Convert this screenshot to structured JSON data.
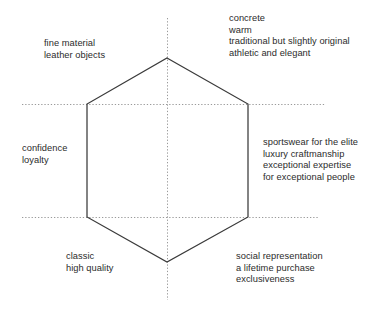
{
  "diagram": {
    "type": "hexagon-brand-positioning",
    "shape": {
      "name": "hexagon",
      "stroke_color": "#3a3a3a",
      "fill": "none",
      "vertices": [
        {
          "name": "top",
          "x": 167,
          "y": 58
        },
        {
          "name": "upper-right",
          "x": 248,
          "y": 104
        },
        {
          "name": "lower-right",
          "x": 248,
          "y": 217
        },
        {
          "name": "bottom",
          "x": 167,
          "y": 262
        },
        {
          "name": "lower-left",
          "x": 87,
          "y": 217
        },
        {
          "name": "upper-left",
          "x": 87,
          "y": 104
        }
      ]
    },
    "guides": {
      "color": "#9a9a9a",
      "style": "dotted",
      "vertical": [
        {
          "x": 167,
          "y1": 18,
          "y2": 300
        }
      ],
      "horizontal": [
        {
          "y": 104,
          "x1": 22,
          "x2": 325
        },
        {
          "y": 217,
          "x1": 22,
          "x2": 318
        }
      ]
    },
    "labels": [
      {
        "id": "fine-material",
        "position": "upper-left",
        "lines": [
          "fine material",
          "leather objects"
        ]
      },
      {
        "id": "concrete",
        "position": "upper-right",
        "lines": [
          "concrete",
          "warm",
          "traditional but slightly original",
          "athletic and elegant"
        ]
      },
      {
        "id": "confidence",
        "position": "middle-left",
        "lines": [
          "confidence",
          "loyalty"
        ]
      },
      {
        "id": "sportswear",
        "position": "middle-right",
        "lines": [
          "sportswear for the elite",
          "luxury craftmanship",
          "exceptional expertise",
          "for exceptional people"
        ]
      },
      {
        "id": "classic",
        "position": "lower-left",
        "lines": [
          "classic",
          "high quality"
        ]
      },
      {
        "id": "social",
        "position": "lower-right",
        "lines": [
          "social representation",
          "a lifetime purchase",
          "exclusiveness"
        ]
      }
    ]
  }
}
